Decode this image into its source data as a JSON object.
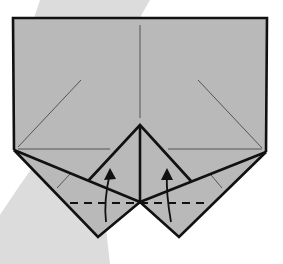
{
  "diagram": {
    "type": "origami-fold-step",
    "colors": {
      "background": "#ffffff",
      "swoosh": "#dcdcdc",
      "paper": "#b9b9b9",
      "outline": "#111111",
      "crease": "#555555",
      "arrow": "#111111"
    },
    "labels": [],
    "instructions": {
      "fold_line": "valley-fold (dashed)",
      "arrows": [
        "fold left flap up",
        "fold right flap up"
      ]
    }
  }
}
